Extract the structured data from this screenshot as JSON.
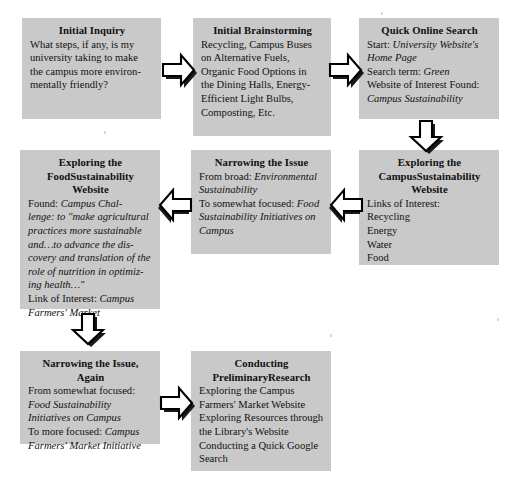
{
  "diagram": {
    "box_fill": "#c9c9c9",
    "text_color": "#111111",
    "arrow_fill": "#ffffff",
    "arrow_stroke": "#000000",
    "arrow_shadow": "#111111"
  },
  "nodes": {
    "initial_inquiry": {
      "title": "Initial Inquiry",
      "lines": [
        "What steps, if any, is my",
        "university taking to make",
        "the campus more environ-",
        "mentally friendly?"
      ]
    },
    "initial_brainstorming": {
      "title": "Initial Brainstorming",
      "lines": [
        "Recycling, Campus Buses",
        "on Alternative Fuels,",
        "Organic Food Options in",
        "the Dining Halls, Energy-",
        "Efficient Light Bulbs,",
        "Composting, Etc."
      ]
    },
    "quick_online_search": {
      "title": "Quick Online Search",
      "lines": [
        {
          "plain": "Start: ",
          "italic": "University Website's"
        },
        {
          "plain": "",
          "italic": "Home Page"
        },
        {
          "plain": "Search term: ",
          "italic": "Green"
        },
        {
          "plain": "Website of Interest Found:",
          "italic": ""
        },
        {
          "plain": "",
          "italic": "Campus Sustainability"
        }
      ]
    },
    "exploring_campus_sustainability": {
      "title": "Exploring the Campus Sustainability Website",
      "title_lines": [
        "Exploring the Campus",
        "Sustainability Website"
      ],
      "lines": [
        "Links of Interest:",
        "Recycling",
        "Energy",
        "Water",
        "Food"
      ]
    },
    "narrowing_the_issue": {
      "title": "Narrowing the Issue",
      "lines": [
        {
          "plain": "From broad: ",
          "italic": "Environmental"
        },
        {
          "plain": "",
          "italic": "Sustainability"
        },
        {
          "plain": "To somewhat focused: ",
          "italic": "Food"
        },
        {
          "plain": "",
          "italic": "Sustainability Initiatives on"
        },
        {
          "plain": "",
          "italic": "Campus"
        }
      ]
    },
    "exploring_food_sustainability": {
      "title": "Exploring the Food Sustainability Website",
      "title_lines": [
        "Exploring the Food",
        "Sustainability Website"
      ],
      "lines": [
        {
          "plain": "Found: ",
          "italic": "Campus Chal-"
        },
        {
          "plain": "",
          "italic": "lenge: to \"make agricultural"
        },
        {
          "plain": "",
          "italic": "practices more sustainable"
        },
        {
          "plain": "",
          "italic": "and…to advance the dis-"
        },
        {
          "plain": "",
          "italic": "covery and translation of the"
        },
        {
          "plain": "",
          "italic": "role of nutrition in optimiz-"
        },
        {
          "plain": "",
          "italic": "ing health…\""
        },
        {
          "plain": "Link of Interest: ",
          "italic": "Campus"
        },
        {
          "plain": "",
          "italic": "Farmers' Market"
        }
      ]
    },
    "narrowing_again": {
      "title": "Narrowing the Issue, Again",
      "lines": [
        {
          "plain": "From somewhat focused:",
          "italic": ""
        },
        {
          "plain": "",
          "italic": "Food Sustainability"
        },
        {
          "plain": "",
          "italic": "Initiatives on Campus"
        },
        {
          "plain": "To more focused: ",
          "italic": "Campus"
        },
        {
          "plain": "",
          "italic": "Farmers' Market Initiative"
        }
      ]
    },
    "conducting_preliminary_research": {
      "title": "Conducting Preliminary Research",
      "title_lines": [
        "Conducting Preliminary",
        "Research"
      ],
      "lines": [
        "Exploring the Campus",
        "Farmers' Market Website",
        "Exploring Resources through",
        "the Library's Website",
        "Conducting a Quick Google",
        "Search"
      ]
    }
  },
  "arrows": [
    {
      "name": "arrow-inquiry-to-brainstorming",
      "direction": "right"
    },
    {
      "name": "arrow-brainstorming-to-search",
      "direction": "right"
    },
    {
      "name": "arrow-search-to-campus-site",
      "direction": "down"
    },
    {
      "name": "arrow-campus-site-to-narrowing",
      "direction": "left"
    },
    {
      "name": "arrow-narrowing-to-food-site",
      "direction": "left"
    },
    {
      "name": "arrow-food-site-to-narrowing-again",
      "direction": "down"
    },
    {
      "name": "arrow-narrowing-again-to-research",
      "direction": "right"
    }
  ]
}
